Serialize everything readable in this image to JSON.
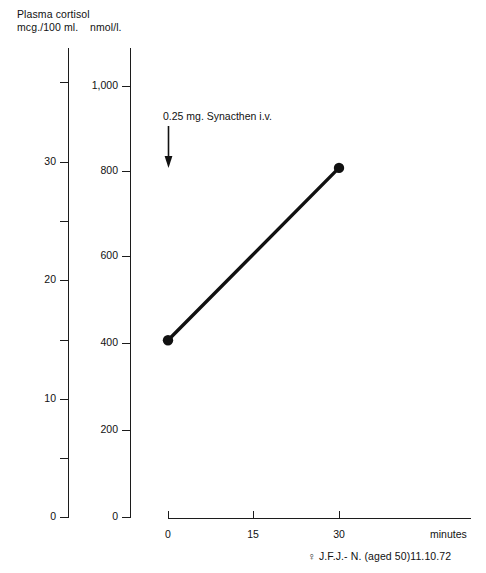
{
  "figure": {
    "headers": {
      "left_axis_title": "Plasma cortisol\nmcg./100 ml.",
      "right_axis_title": "nmol/l."
    },
    "annotation": "0.25 mg. Synacthen i.v.",
    "arrow_name": "down-arrow-icon",
    "minutes_label": "minutes",
    "caption": "♀ J.F.J.- N. (aged 50)11.10.72"
  },
  "chart_data": {
    "type": "line",
    "title": "Plasma cortisol",
    "xlabel": "minutes",
    "ylabel": "nmol/l.",
    "y2label": "mcg./100 ml.",
    "x": [
      0,
      30
    ],
    "values": [
      410,
      810
    ],
    "series": [
      {
        "name": "Plasma cortisol",
        "values": [
          410,
          810
        ],
        "units": "nmol/l."
      }
    ],
    "xlim": [
      0,
      45
    ],
    "xticks": [
      0,
      15,
      30
    ],
    "xticklabels": [
      "0",
      "15",
      "30"
    ],
    "ylim": [
      0,
      1080
    ],
    "yticks": [
      0,
      200,
      400,
      600,
      800,
      1000
    ],
    "yticklabels": [
      "0",
      "200",
      "400",
      "600",
      "800",
      "1,000"
    ],
    "y2lim": [
      0,
      39
    ],
    "y2ticks": [
      0,
      5,
      10,
      15,
      20,
      25,
      30,
      35
    ],
    "y2ticklabels": [
      "0",
      "",
      "10",
      "",
      "20",
      "",
      "30",
      ""
    ],
    "y2_major": [
      0,
      10,
      20,
      30
    ],
    "y2_minor": [
      5,
      15,
      25,
      35
    ],
    "grid": false,
    "legend": false,
    "marker": "filled-circle",
    "line_color": "#111111",
    "annotations": [
      {
        "text": "0.25 mg. Synacthen i.v.",
        "x": 0,
        "y": 930,
        "arrow": "down"
      }
    ],
    "caption": "♀ J.F.J.- N. (aged 50)11.10.72"
  },
  "ticks_nmol": [
    {
      "label": "1,000",
      "top": 84
    },
    {
      "label": "800",
      "top": 169
    },
    {
      "label": "600",
      "top": 254
    },
    {
      "label": "400",
      "top": 341
    },
    {
      "label": "200",
      "top": 428
    },
    {
      "label": "0",
      "top": 515
    }
  ],
  "ticks_mcg": [
    {
      "label": "",
      "top": 80
    },
    {
      "label": "30",
      "top": 160
    },
    {
      "label": "",
      "top": 219
    },
    {
      "label": "20",
      "top": 278
    },
    {
      "label": "",
      "top": 338
    },
    {
      "label": "10",
      "top": 397
    },
    {
      "label": "",
      "top": 456
    },
    {
      "label": "0",
      "top": 515
    }
  ],
  "ticks_x": [
    {
      "label": "0",
      "left": 168
    },
    {
      "label": "15",
      "left": 253
    },
    {
      "label": "30",
      "left": 339
    }
  ]
}
